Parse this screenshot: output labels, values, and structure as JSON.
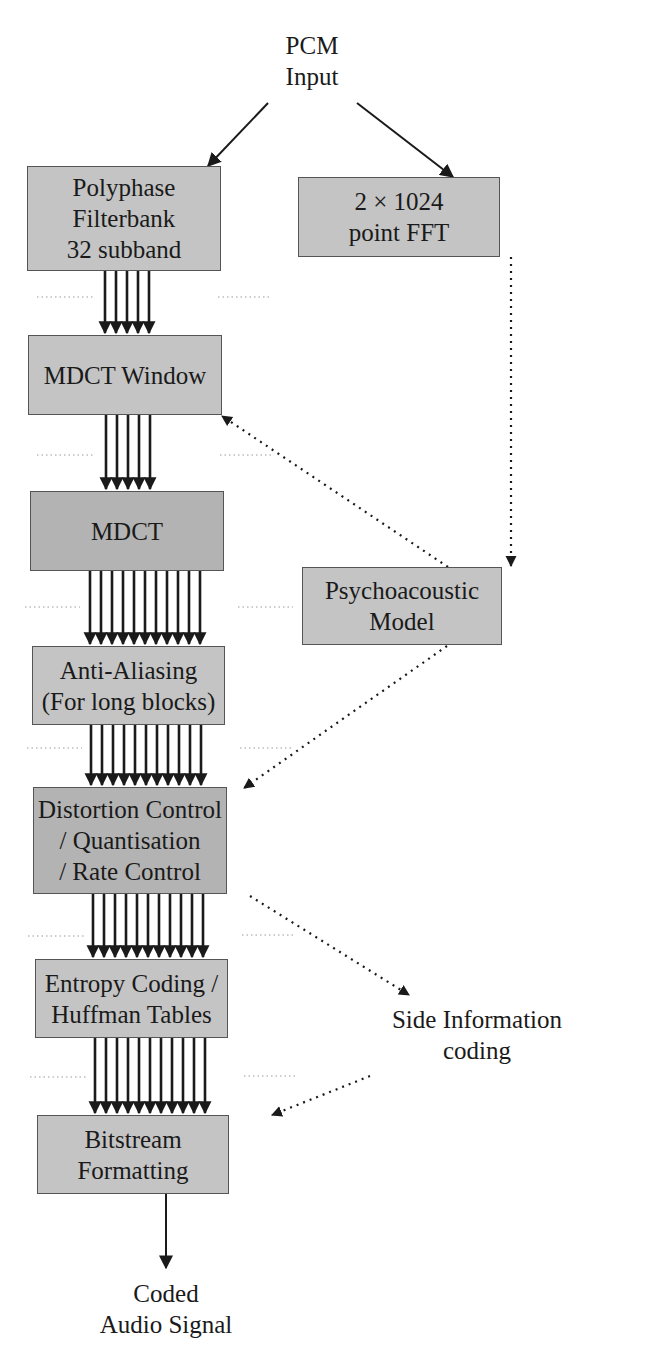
{
  "diagram": {
    "input": {
      "lines": [
        "PCM",
        "Input"
      ]
    },
    "output": {
      "lines": [
        "Coded",
        "Audio Signal"
      ]
    },
    "side_info": {
      "lines": [
        "Side Information",
        "coding"
      ]
    },
    "main_chain": [
      {
        "id": "polyphase",
        "lines": [
          "Polyphase",
          "Filterbank",
          "32 subband"
        ]
      },
      {
        "id": "mdct_window",
        "lines": [
          "MDCT Window"
        ]
      },
      {
        "id": "mdct",
        "lines": [
          "MDCT"
        ]
      },
      {
        "id": "anti_aliasing",
        "lines": [
          "Anti-Aliasing",
          "(For long blocks)"
        ]
      },
      {
        "id": "distortion",
        "lines": [
          "Distortion Control",
          "/ Quantisation",
          "/ Rate Control"
        ]
      },
      {
        "id": "entropy",
        "lines": [
          "Entropy Coding /",
          "Huffman Tables"
        ]
      },
      {
        "id": "bitstream",
        "lines": [
          "Bitstream",
          "Formatting"
        ]
      }
    ],
    "side_chain": [
      {
        "id": "fft",
        "lines": [
          "2 × 1024",
          "point FFT"
        ]
      },
      {
        "id": "psychoacoustic",
        "lines": [
          "Psychoacoustic",
          "Model"
        ]
      }
    ],
    "connections": [
      {
        "from": "input",
        "to": "polyphase",
        "style": "solid"
      },
      {
        "from": "input",
        "to": "fft",
        "style": "solid"
      },
      {
        "from": "polyphase",
        "to": "mdct_window",
        "style": "multi-solid",
        "count": 5
      },
      {
        "from": "mdct_window",
        "to": "mdct",
        "style": "multi-solid",
        "count": 5
      },
      {
        "from": "mdct",
        "to": "anti_aliasing",
        "style": "multi-solid",
        "count": 11
      },
      {
        "from": "anti_aliasing",
        "to": "distortion",
        "style": "multi-solid",
        "count": 11
      },
      {
        "from": "distortion",
        "to": "entropy",
        "style": "multi-solid",
        "count": 11
      },
      {
        "from": "entropy",
        "to": "bitstream",
        "style": "multi-solid",
        "count": 11
      },
      {
        "from": "bitstream",
        "to": "output",
        "style": "solid"
      },
      {
        "from": "fft",
        "to": "psychoacoustic",
        "style": "dotted"
      },
      {
        "from": "psychoacoustic",
        "to": "mdct_window",
        "style": "dotted"
      },
      {
        "from": "psychoacoustic",
        "to": "distortion",
        "style": "dotted"
      },
      {
        "from": "distortion",
        "to": "side_info",
        "style": "dotted"
      },
      {
        "from": "side_info",
        "to": "bitstream",
        "style": "dotted"
      }
    ],
    "colors": {
      "box_fill_light": "#c4c4c4",
      "box_fill_dark": "#b3b3b3",
      "box_border": "#555555",
      "line": "#1a1a1a",
      "guide_dots": "#9a9a9a"
    }
  }
}
